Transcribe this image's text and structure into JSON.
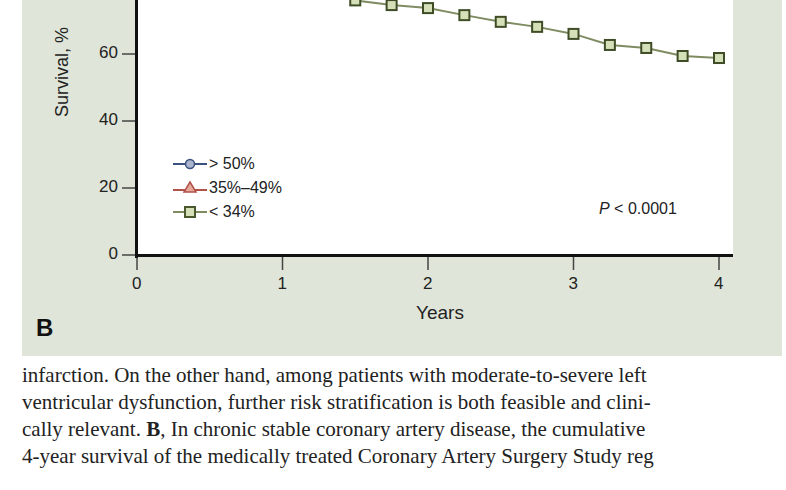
{
  "figure": {
    "panel_label": "B",
    "legend": [
      {
        "label": "> 50%",
        "marker": "circle",
        "color": "#3b4f80",
        "fill": "#aab4cc"
      },
      {
        "label": "35%–49%",
        "marker": "triangle",
        "color": "#b0524a",
        "fill": "#e6a89a"
      },
      {
        "label": "< 34%",
        "marker": "square",
        "color": "#5a6b3a",
        "fill": "#d6e0b8"
      }
    ],
    "annotation": {
      "italic": "P",
      "rest": " < 0.0001"
    },
    "xlabel": "Years",
    "ylabel": "Survival, %",
    "xticks": [
      "0",
      "1",
      "2",
      "3",
      "4"
    ],
    "yticks": [
      "0",
      "20",
      "40",
      "60"
    ]
  },
  "chart_data": {
    "type": "line",
    "title": "",
    "xlabel": "Years",
    "ylabel": "Survival, %",
    "xlim": [
      0,
      4
    ],
    "ylim": [
      0,
      80
    ],
    "xticks": [
      0,
      1,
      2,
      3,
      4
    ],
    "yticks": [
      0,
      20,
      40,
      60
    ],
    "grid": false,
    "legend_position": "lower left",
    "annotations": [
      "P < 0.0001"
    ],
    "series": [
      {
        "name": "< 34%",
        "marker": "square",
        "color": "#5a6b3a",
        "x": [
          1.5,
          1.75,
          2.0,
          2.25,
          2.5,
          2.75,
          3.0,
          3.25,
          3.5,
          3.75,
          4.0
        ],
        "values": [
          76,
          74.6,
          73.7,
          71.6,
          69.6,
          68.1,
          66,
          62.7,
          61.8,
          59.4,
          58.8
        ]
      },
      {
        "name": "> 50%",
        "marker": "circle",
        "color": "#3b4f80",
        "x": [],
        "values": []
      },
      {
        "name": "35%–49%",
        "marker": "triangle",
        "color": "#b0524a",
        "x": [],
        "values": []
      }
    ]
  },
  "caption": {
    "lines": [
      {
        "text": "infarction. On the other hand, among patients with moderate-to-severe left"
      },
      {
        "text": "ventricular dysfunction, further risk stratification is both feasible and clini-"
      },
      {
        "pre": "cally relevant. ",
        "bold": "B",
        "post": ", In chronic stable coronary artery disease, the cumulative"
      },
      {
        "text": "4-year survival of the medically treated Coronary Artery Surgery Study reg"
      }
    ]
  }
}
